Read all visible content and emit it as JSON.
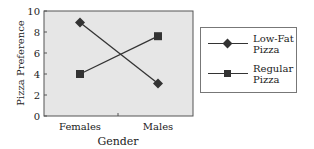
{
  "chart_data": {
    "type": "line",
    "title": "",
    "xlabel": "Gender",
    "ylabel": "Pizza Preference",
    "categories": [
      "Females",
      "Males"
    ],
    "series": [
      {
        "name": "Low-Fat Pizza",
        "marker": "diamond",
        "values": [
          8.9,
          3.1
        ]
      },
      {
        "name": "Regular Pizza",
        "marker": "square",
        "values": [
          4.0,
          7.6
        ]
      }
    ],
    "ylim": [
      0,
      10
    ],
    "yticks": [
      0,
      2,
      4,
      6,
      8,
      10
    ],
    "grid": false,
    "legend_position": "right",
    "plot_background": "#e6e6e6",
    "line_color": "#333333"
  },
  "legend": {
    "items": [
      {
        "line1": "Low-Fat",
        "line2": "Pizza"
      },
      {
        "line1": "Regular",
        "line2": "Pizza"
      }
    ]
  },
  "axes": {
    "ylabel": "Pizza Preference",
    "xlabel": "Gender",
    "yticks": [
      "0",
      "2",
      "4",
      "6",
      "8",
      "10"
    ],
    "xticks": [
      "Females",
      "Males"
    ]
  }
}
